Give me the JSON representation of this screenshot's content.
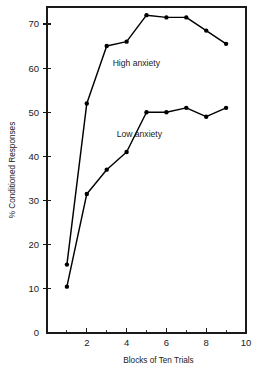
{
  "chart_data": {
    "type": "line",
    "title": "",
    "xlabel": "Blocks of Ten Trials",
    "ylabel": "% Conditioned Responses",
    "x": [
      1,
      2,
      3,
      4,
      5,
      6,
      7,
      8,
      9
    ],
    "xlim": [
      0,
      10
    ],
    "ylim": [
      0,
      75
    ],
    "xticks": [
      0,
      1,
      2,
      3,
      4,
      5,
      6,
      7,
      8,
      9,
      10
    ],
    "xtick_labels_major": [
      "2",
      "4",
      "6",
      "8",
      "10"
    ],
    "xticks_major": [
      2,
      4,
      6,
      8,
      10
    ],
    "yticks": [
      0,
      10,
      20,
      30,
      40,
      50,
      60,
      70
    ],
    "ytick_labels": [
      "0",
      "10",
      "20",
      "30",
      "40",
      "50",
      "60",
      "70"
    ],
    "grid": false,
    "legend": "inline-annotations",
    "series": [
      {
        "name": "High anxiety",
        "values": [
          15.5,
          52,
          65,
          66,
          72,
          71.5,
          71.5,
          68.5,
          65.5
        ],
        "label_x": 3.3,
        "label_y": 60.5
      },
      {
        "name": "Low anxiety",
        "values": [
          10.5,
          31.5,
          37,
          41,
          50,
          50,
          51,
          49,
          51
        ],
        "label_x": 3.5,
        "label_y": 44.5
      }
    ],
    "annotations": [
      {
        "text": "High anxiety",
        "series": "High anxiety"
      },
      {
        "text": "Low anxiety",
        "series": "Low anxiety"
      }
    ],
    "colors": {
      "line": "#000000",
      "marker": "#000000",
      "axis": "#1a1a1a",
      "background": "#ffffff"
    }
  }
}
